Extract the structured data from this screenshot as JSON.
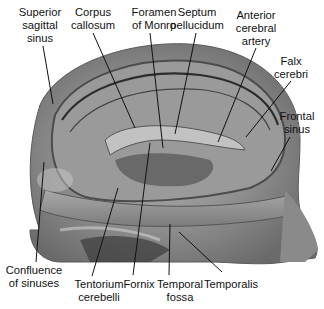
{
  "figure": {
    "colors": {
      "background": "#ffffff",
      "specimen_base": "#8e8e8e",
      "specimen_light": "#b8b8b8",
      "specimen_dark": "#3a3a3a",
      "leader_line": "#111111",
      "label_text": "#111111"
    }
  },
  "labels": [
    {
      "id": "superior-sagittal-sinus",
      "lines": [
        "Superior",
        "sagittal",
        "sinus"
      ],
      "x": 40,
      "y": 6,
      "line": [
        43,
        46,
        53,
        104
      ]
    },
    {
      "id": "corpus-callosum",
      "lines": [
        "Corpus",
        "callosum"
      ],
      "x": 93,
      "y": 6,
      "line": [
        93,
        33,
        135,
        128
      ]
    },
    {
      "id": "foramen-of-monro",
      "lines": [
        "Foramen",
        "of Monro"
      ],
      "x": 154,
      "y": 6,
      "line": [
        150,
        33,
        163,
        148
      ]
    },
    {
      "id": "septum-pellucidum",
      "lines": [
        "Septum",
        "pellucidum"
      ],
      "x": 197,
      "y": 6,
      "line": [
        196,
        33,
        175,
        134
      ]
    },
    {
      "id": "anterior-cerebral-artery",
      "lines": [
        "Anterior",
        "cerebral",
        "artery"
      ],
      "x": 256,
      "y": 11,
      "line": [
        256,
        48,
        218,
        142
      ]
    },
    {
      "id": "falx-cerebri",
      "lines": [
        "Falx",
        "cerebri"
      ],
      "x": 291,
      "y": 55,
      "line": [
        291,
        81,
        246,
        137
      ]
    },
    {
      "id": "frontal-sinus",
      "lines": [
        "Frontal",
        "sinus"
      ],
      "x": 296,
      "y": 111,
      "line": [
        290,
        137,
        271,
        171
      ]
    },
    {
      "id": "confluence-of-sinuses",
      "lines": [
        "Confluence",
        "of sinuses"
      ],
      "x": 38,
      "y": 263,
      "line": [
        44,
        162,
        36,
        262
      ]
    },
    {
      "id": "tentorium-cerebelli",
      "lines": [
        "Tentorium",
        "cerebelli"
      ],
      "x": 99,
      "y": 276,
      "line": [
        118,
        188,
        92,
        276
      ]
    },
    {
      "id": "fornix",
      "lines": [
        "Fornix"
      ],
      "x": 133,
      "y": 276,
      "line": [
        150,
        143,
        133,
        275
      ]
    },
    {
      "id": "temporal-fossa",
      "lines": [
        "Temporal",
        "fossa"
      ],
      "x": 170,
      "y": 276,
      "line": [
        170,
        224,
        169,
        275
      ]
    },
    {
      "id": "temporalis",
      "lines": [
        "Temporalis"
      ],
      "x": 225,
      "y": 276,
      "line": [
        179,
        232,
        222,
        272
      ]
    }
  ]
}
